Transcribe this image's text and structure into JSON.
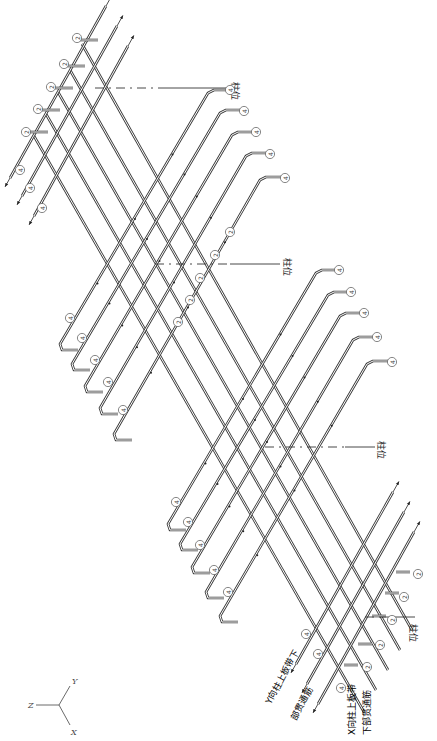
{
  "diagram": {
    "labels": {
      "column_position": "柱位",
      "y_strip_bottom_bar_line1": "Y向柱上板带下",
      "y_strip_bottom_bar_line2": "部贯通筋",
      "x_strip_bottom_bar_line1": "X向柱上板带",
      "x_strip_bottom_bar_line2": "下部贯通筋"
    },
    "bar_marks": {
      "mark_2": "2",
      "mark_4": "4"
    },
    "axes": {
      "x": "X",
      "y": "Y",
      "z": "Z"
    },
    "column_markers": [
      {
        "label": "柱位",
        "line": [
          [
            160,
            88
          ],
          [
            228,
            88
          ]
        ],
        "dash": [
          [
            95,
            88
          ],
          [
            160,
            88
          ]
        ],
        "text_xy": [
          232,
          82
        ]
      },
      {
        "label": "柱位",
        "line": [
          [
            230,
            264
          ],
          [
            280,
            264
          ]
        ],
        "dash": [
          [
            155,
            264
          ],
          [
            230,
            264
          ]
        ],
        "text_xy": [
          284,
          258
        ]
      },
      {
        "label": "柱位",
        "line": [
          [
            345,
            447
          ],
          [
            375,
            447
          ]
        ],
        "dash": [
          [
            265,
            447
          ],
          [
            345,
            447
          ]
        ],
        "text_xy": [
          378,
          441
        ]
      },
      {
        "label": "柱位",
        "line": [
          [
            380,
            617
          ],
          [
            415,
            617
          ]
        ],
        "dash": [
          [
            365,
            617
          ],
          [
            380,
            617
          ]
        ],
        "text_xy": [
          410,
          624
        ]
      }
    ],
    "straight_bars_top": [
      {
        "from": [
          10,
          178
        ],
        "to": [
          106,
          6
        ],
        "mark": "4",
        "mark_xy": [
          20,
          170
        ]
      },
      {
        "from": [
          22,
          196
        ],
        "to": [
          117,
          26
        ],
        "mark": "4",
        "mark_xy": [
          30,
          188
        ]
      },
      {
        "from": [
          34,
          216
        ],
        "to": [
          128,
          46
        ],
        "mark": "4",
        "mark_xy": [
          42,
          208
        ]
      }
    ],
    "hook_bars_mark2_top": [
      {
        "start": [
          80,
          40
        ],
        "hook_len": 18,
        "mark_xy": [
          77,
          38
        ]
      },
      {
        "start": [
          67,
          66
        ],
        "hook_len": 18,
        "mark_xy": [
          64,
          64
        ]
      },
      {
        "start": [
          55,
          88
        ],
        "hook_len": 18,
        "mark_xy": [
          51,
          87
        ]
      },
      {
        "start": [
          42,
          110
        ],
        "hook_len": 18,
        "mark_xy": [
          38,
          109
        ]
      },
      {
        "start": [
          30,
          132
        ],
        "hook_len": 18,
        "mark_xy": [
          26,
          132
        ]
      }
    ],
    "long_diagonals_mark2": [
      {
        "from": [
          82,
          44
        ],
        "to": [
          412,
          630
        ],
        "mark_xy": [
          230,
          232
        ]
      },
      {
        "from": [
          70,
          70
        ],
        "to": [
          400,
          650
        ],
        "mark_xy": [
          215,
          255
        ]
      },
      {
        "from": [
          58,
          92
        ],
        "to": [
          388,
          670
        ],
        "mark_xy": [
          200,
          278
        ]
      },
      {
        "from": [
          46,
          114
        ],
        "to": [
          376,
          690
        ],
        "mark_xy": [
          190,
          300
        ]
      },
      {
        "from": [
          34,
          136
        ],
        "to": [
          364,
          712
        ],
        "mark_xy": [
          178,
          322
        ]
      }
    ],
    "hook_bars_left_group": [
      {
        "bottom_hook": [
          60,
          348
        ],
        "top_hook": [
          210,
          90
        ],
        "mark_top_xy": [
          230,
          90
        ],
        "mark_bot_xy": [
          70,
          318
        ]
      },
      {
        "bottom_hook": [
          72,
          368
        ],
        "top_hook": [
          222,
          110
        ],
        "mark_top_xy": [
          244,
          111
        ],
        "mark_bot_xy": [
          82,
          338
        ]
      },
      {
        "bottom_hook": [
          85,
          390
        ],
        "top_hook": [
          234,
          132
        ],
        "mark_top_xy": [
          256,
          132
        ],
        "mark_bot_xy": [
          95,
          360
        ]
      },
      {
        "bottom_hook": [
          100,
          412
        ],
        "top_hook": [
          248,
          153
        ],
        "mark_top_xy": [
          270,
          154
        ],
        "mark_bot_xy": [
          108,
          382
        ]
      },
      {
        "bottom_hook": [
          114,
          438
        ],
        "top_hook": [
          262,
          177
        ],
        "mark_top_xy": [
          285,
          178
        ],
        "mark_bot_xy": [
          123,
          410
        ]
      }
    ],
    "hook_bars_right_group": [
      {
        "bottom_hook": [
          168,
          528
        ],
        "top_hook": [
          318,
          270
        ],
        "mark_top_xy": [
          339,
          270
        ],
        "mark_bot_xy": [
          176,
          502
        ]
      },
      {
        "bottom_hook": [
          180,
          548
        ],
        "top_hook": [
          330,
          292
        ],
        "mark_top_xy": [
          351,
          292
        ],
        "mark_bot_xy": [
          188,
          522
        ]
      },
      {
        "bottom_hook": [
          192,
          571
        ],
        "top_hook": [
          342,
          313
        ],
        "mark_top_xy": [
          364,
          313
        ],
        "mark_bot_xy": [
          200,
          545
        ]
      },
      {
        "bottom_hook": [
          206,
          596
        ],
        "top_hook": [
          355,
          337
        ],
        "mark_top_xy": [
          377,
          337
        ],
        "mark_bot_xy": [
          214,
          570
        ]
      },
      {
        "bottom_hook": [
          220,
          620
        ],
        "top_hook": [
          369,
          361
        ],
        "mark_top_xy": [
          392,
          362
        ],
        "mark_bot_xy": [
          228,
          592
        ]
      }
    ],
    "straight_bars_bottom": [
      {
        "from": [
          296,
          664
        ],
        "to": [
          393,
          492
        ],
        "mark": "4",
        "mark_xy": [
          306,
          634
        ]
      },
      {
        "from": [
          307,
          684
        ],
        "to": [
          404,
          512
        ],
        "mark": "4",
        "mark_xy": [
          318,
          654
        ]
      },
      {
        "from": [
          318,
          704
        ],
        "to": [
          414,
          532
        ],
        "mark": "4",
        "mark_xy": [
          341,
          688
        ]
      }
    ],
    "hook_bars_mark2_bottom": [
      {
        "start": [
          396,
          572
        ],
        "hook_len": 14,
        "mark_xy": [
          418,
          574
        ]
      },
      {
        "start": [
          385,
          593
        ],
        "hook_len": 14,
        "mark_xy": [
          404,
          597
        ]
      },
      {
        "start": [
          372,
          616
        ],
        "hook_len": 14,
        "mark_xy": [
          392,
          620
        ]
      },
      {
        "start": [
          358,
          644
        ],
        "hook_len": 14,
        "mark_xy": [
          380,
          645
        ]
      },
      {
        "start": [
          344,
          665
        ],
        "hook_len": 14,
        "mark_xy": [
          367,
          667
        ]
      }
    ],
    "axis_origin": [
      59,
      705
    ],
    "axis_ends": {
      "y": [
        70,
        686
      ],
      "z": [
        36,
        705
      ],
      "x": [
        70,
        725
      ]
    },
    "colors": {
      "line": "#3a3a3a",
      "background": "#ffffff",
      "text": "#222222"
    }
  }
}
